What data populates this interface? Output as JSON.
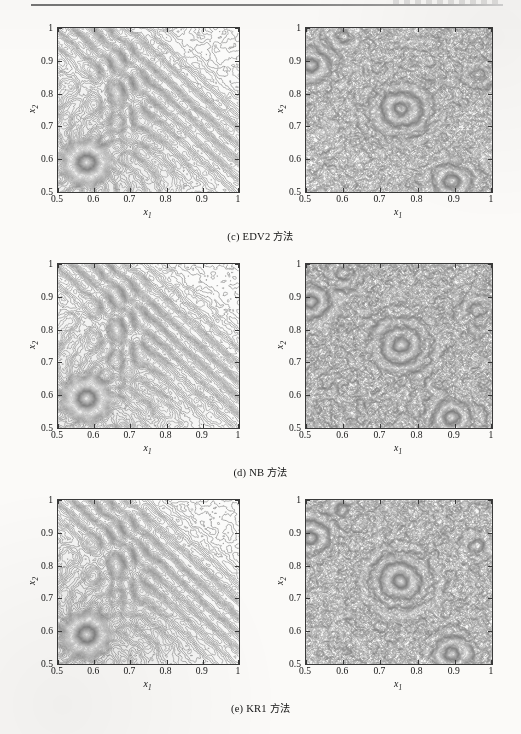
{
  "page": {
    "width": 521,
    "height": 734,
    "background": "#fbfaf8",
    "ink": "#1a1a1a"
  },
  "header": {
    "rule_visible": true,
    "faint_text": ""
  },
  "axes": {
    "x_ticks": [
      "0.5",
      "0.6",
      "0.7",
      "0.8",
      "0.9",
      "1"
    ],
    "y_ticks": [
      "0.5",
      "0.6",
      "0.7",
      "0.8",
      "0.9",
      "1"
    ],
    "x_tick_values": [
      0.5,
      0.6,
      0.7,
      0.8,
      0.9,
      1.0
    ],
    "y_tick_values": [
      0.5,
      0.6,
      0.7,
      0.8,
      0.9,
      1.0
    ],
    "xlabel_base": "x",
    "xlabel_sub": "1",
    "ylabel_base": "x",
    "ylabel_sub": "2",
    "xlim": [
      0.5,
      1.0
    ],
    "ylim": [
      0.5,
      1.0
    ]
  },
  "rows": [
    {
      "caption_prefix": "(c)",
      "caption_method": "EDV2",
      "caption_suffix": "方法",
      "left": {
        "name": "contour-plot-edv2-left",
        "seed": 11,
        "style": "interference"
      },
      "right": {
        "name": "contour-plot-edv2-right",
        "seed": 21,
        "style": "speckle"
      }
    },
    {
      "caption_prefix": "(d)",
      "caption_method": "NB",
      "caption_suffix": "方法",
      "left": {
        "name": "contour-plot-nb-left",
        "seed": 12,
        "style": "interference"
      },
      "right": {
        "name": "contour-plot-nb-right",
        "seed": 22,
        "style": "speckle"
      }
    },
    {
      "caption_prefix": "(e)",
      "caption_method": "KR1",
      "caption_suffix": "方法",
      "left": {
        "name": "contour-plot-kr1-left",
        "seed": 13,
        "style": "interference"
      },
      "right": {
        "name": "contour-plot-kr1-right",
        "seed": 23,
        "style": "speckle"
      }
    }
  ],
  "chart_data": {
    "type": "contour",
    "panels": [
      {
        "id": "c-left",
        "title": "(c) EDV2 方法 — left panel",
        "xlabel": "x1",
        "ylabel": "x2",
        "xlim": [
          0.5,
          1.0
        ],
        "ylim": [
          0.5,
          1.0
        ],
        "grid": false,
        "description": "Grey contour map of an error field; diagonal interference fringes running from lower-left to upper-right, with a strong concentrated ring structure (hot spot) centred near (0.58, 0.59) and secondary fringe bands along the anti-diagonal.",
        "features": [
          {
            "type": "hotspot",
            "x": 0.58,
            "y": 0.59,
            "radius": 0.06,
            "intensity": 1.0
          },
          {
            "type": "fringe-band",
            "orientation": "anti-diagonal",
            "from": [
              0.5,
              1.0
            ],
            "to": [
              1.0,
              0.62
            ],
            "intensity": 0.45
          },
          {
            "type": "fringe-band",
            "orientation": "vertical",
            "x": 0.68,
            "intensity": 0.4
          },
          {
            "type": "ripples",
            "origin": [
              0.58,
              0.59
            ],
            "wavelength": 0.018,
            "intensity": 0.7
          }
        ],
        "levels": 40,
        "colormap": "grey"
      },
      {
        "id": "c-right",
        "title": "(c) EDV2 方法 — right panel",
        "xlabel": "x1",
        "ylabel": "x2",
        "xlim": [
          0.5,
          1.0
        ],
        "ylim": [
          0.5,
          1.0
        ],
        "grid": false,
        "description": "Dense isotropic contour noise filling the whole domain; local concentrated swirl features near (0.51, 0.88), (0.75, 0.75) and (0.89, 0.53).",
        "features": [
          {
            "type": "swirl",
            "x": 0.51,
            "y": 0.88,
            "radius": 0.05,
            "intensity": 0.9
          },
          {
            "type": "swirl",
            "x": 0.75,
            "y": 0.75,
            "radius": 0.07,
            "intensity": 0.8
          },
          {
            "type": "swirl",
            "x": 0.89,
            "y": 0.53,
            "radius": 0.05,
            "intensity": 0.85
          },
          {
            "type": "noise",
            "scale": 0.03,
            "intensity": 0.6
          }
        ],
        "levels": 40,
        "colormap": "grey"
      },
      {
        "id": "d-left",
        "title": "(d) NB 方法 — left panel",
        "xlabel": "x1",
        "ylabel": "x2",
        "xlim": [
          0.5,
          1.0
        ],
        "ylim": [
          0.5,
          1.0
        ],
        "grid": false,
        "description": "Essentially the same interference contour field as panel (c) left: anti-diagonal fringes plus a concentrated ring hot spot near (0.58, 0.59).",
        "features": [
          {
            "type": "hotspot",
            "x": 0.58,
            "y": 0.59,
            "radius": 0.06,
            "intensity": 1.0
          },
          {
            "type": "fringe-band",
            "orientation": "anti-diagonal",
            "from": [
              0.5,
              1.0
            ],
            "to": [
              1.0,
              0.62
            ],
            "intensity": 0.45
          },
          {
            "type": "ripples",
            "origin": [
              0.58,
              0.59
            ],
            "wavelength": 0.018,
            "intensity": 0.7
          }
        ],
        "levels": 40,
        "colormap": "grey"
      },
      {
        "id": "d-right",
        "title": "(d) NB 方法 — right panel",
        "xlabel": "x1",
        "ylabel": "x2",
        "xlim": [
          0.5,
          1.0
        ],
        "ylim": [
          0.5,
          1.0
        ],
        "grid": false,
        "description": "Dense isotropic contour noise with swirl features near (0.51, 0.88), (0.75, 0.75) and (0.89, 0.53).",
        "features": [
          {
            "type": "swirl",
            "x": 0.51,
            "y": 0.88,
            "radius": 0.05,
            "intensity": 0.9
          },
          {
            "type": "swirl",
            "x": 0.75,
            "y": 0.75,
            "radius": 0.07,
            "intensity": 0.8
          },
          {
            "type": "swirl",
            "x": 0.89,
            "y": 0.53,
            "radius": 0.05,
            "intensity": 0.85
          },
          {
            "type": "noise",
            "scale": 0.03,
            "intensity": 0.6
          }
        ],
        "levels": 40,
        "colormap": "grey"
      },
      {
        "id": "e-left",
        "title": "(e) KR1 方法 — left panel",
        "xlabel": "x1",
        "ylabel": "x2",
        "xlim": [
          0.5,
          1.0
        ],
        "ylim": [
          0.5,
          1.0
        ],
        "grid": false,
        "description": "Same interference contour field: anti-diagonal fringes with a concentrated ring hot spot near (0.58, 0.59).",
        "features": [
          {
            "type": "hotspot",
            "x": 0.58,
            "y": 0.59,
            "radius": 0.06,
            "intensity": 1.0
          },
          {
            "type": "fringe-band",
            "orientation": "anti-diagonal",
            "from": [
              0.5,
              1.0
            ],
            "to": [
              1.0,
              0.62
            ],
            "intensity": 0.45
          },
          {
            "type": "ripples",
            "origin": [
              0.58,
              0.59
            ],
            "wavelength": 0.018,
            "intensity": 0.7
          }
        ],
        "levels": 40,
        "colormap": "grey"
      },
      {
        "id": "e-right",
        "title": "(e) KR1 方法 — right panel",
        "xlabel": "x1",
        "ylabel": "x2",
        "xlim": [
          0.5,
          1.0
        ],
        "ylim": [
          0.5,
          1.0
        ],
        "grid": false,
        "description": "Dense isotropic contour noise with swirl features near (0.51, 0.88), (0.75, 0.75) and (0.89, 0.53).",
        "features": [
          {
            "type": "swirl",
            "x": 0.51,
            "y": 0.88,
            "radius": 0.05,
            "intensity": 0.9
          },
          {
            "type": "swirl",
            "x": 0.75,
            "y": 0.75,
            "radius": 0.07,
            "intensity": 0.8
          },
          {
            "type": "swirl",
            "x": 0.89,
            "y": 0.53,
            "radius": 0.05,
            "intensity": 0.85
          },
          {
            "type": "noise",
            "scale": 0.03,
            "intensity": 0.6
          }
        ],
        "levels": 40,
        "colormap": "grey"
      }
    ]
  }
}
